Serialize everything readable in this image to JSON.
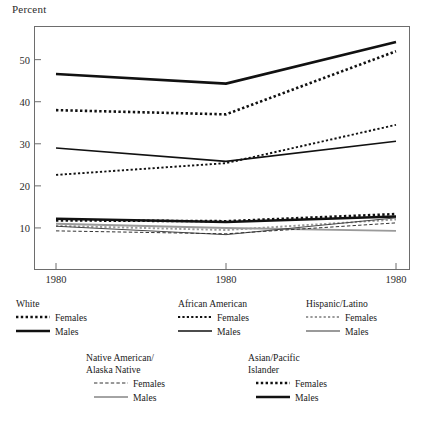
{
  "axis": {
    "y_title": "Percent",
    "y_ticks": [
      10,
      20,
      30,
      40,
      50
    ],
    "x_ticks": [
      "1980",
      "1980",
      "1980"
    ]
  },
  "legend": {
    "groups": [
      {
        "id": "white",
        "heading": "White",
        "entries": [
          {
            "label": "Females",
            "style": "dotted-bold"
          },
          {
            "label": "Males",
            "style": "solid-bold"
          }
        ]
      },
      {
        "id": "african",
        "heading": "African American",
        "entries": [
          {
            "label": "Females",
            "style": "dotted-fine"
          },
          {
            "label": "Males",
            "style": "solid-medium"
          }
        ]
      },
      {
        "id": "hispanic",
        "heading": "Hispanic/Latino",
        "entries": [
          {
            "label": "Females",
            "style": "dotted-gray"
          },
          {
            "label": "Males",
            "style": "solid-gray"
          }
        ]
      },
      {
        "id": "native",
        "heading": "Native American/\nAlaska Native",
        "heading_line1": "Native American/",
        "heading_line2": "Alaska Native",
        "entries": [
          {
            "label": "Females",
            "style": "dashed-thin"
          },
          {
            "label": "Males",
            "style": "solid-thin"
          }
        ]
      },
      {
        "id": "asian",
        "heading": "Asian/Pacific\nIslander",
        "heading_line1": "Asian/Pacific",
        "heading_line2": "Islander",
        "entries": [
          {
            "label": "Females",
            "style": "dotted-bold"
          },
          {
            "label": "Males",
            "style": "solid-bold"
          }
        ]
      }
    ]
  },
  "chart_data": {
    "type": "line",
    "title": "",
    "xlabel": "",
    "ylabel": "Percent",
    "x": [
      "1980",
      "1980",
      "1980"
    ],
    "ylim": [
      0,
      58
    ],
    "xlim": [
      0,
      2
    ],
    "grid": false,
    "legend_position": "below",
    "series": [
      {
        "name": "White Females",
        "group": "White",
        "sex": "Females",
        "style": "dotted-bold",
        "color": "#111111",
        "values": [
          38.0,
          37.0,
          52.0
        ]
      },
      {
        "name": "White Males",
        "group": "White",
        "sex": "Males",
        "style": "solid-bold",
        "color": "#111111",
        "values": [
          46.6,
          44.3,
          54.2
        ]
      },
      {
        "name": "African American Females",
        "group": "African American",
        "sex": "Females",
        "style": "dotted-fine",
        "color": "#111111",
        "values": [
          22.6,
          25.4,
          34.5
        ]
      },
      {
        "name": "African American Males",
        "group": "African American",
        "sex": "Males",
        "style": "solid-medium",
        "color": "#111111",
        "values": [
          29.0,
          25.8,
          30.6
        ]
      },
      {
        "name": "Hispanic/Latino Females",
        "group": "Hispanic/Latino",
        "sex": "Females",
        "style": "dotted-gray",
        "color": "#9a9a9a",
        "values": [
          10.5,
          9.5,
          12.0
        ]
      },
      {
        "name": "Hispanic/Latino Males",
        "group": "Hispanic/Latino",
        "sex": "Males",
        "style": "solid-gray",
        "color": "#9a9a9a",
        "values": [
          11.0,
          10.0,
          9.3
        ]
      },
      {
        "name": "Native American/Alaska Native Females",
        "group": "Native American/Alaska Native",
        "sex": "Females",
        "style": "dashed-thin",
        "color": "#333333",
        "values": [
          9.3,
          8.6,
          11.2
        ]
      },
      {
        "name": "Native American/Alaska Native Males",
        "group": "Native American/Alaska Native",
        "sex": "Males",
        "style": "solid-thin",
        "color": "#333333",
        "values": [
          10.4,
          8.4,
          12.4
        ]
      },
      {
        "name": "Asian/Pacific Islander Females",
        "group": "Asian/Pacific Islander",
        "sex": "Females",
        "style": "dotted-bold",
        "color": "#111111",
        "values": [
          11.8,
          11.6,
          13.3
        ]
      },
      {
        "name": "Asian/Pacific Islander Males",
        "group": "Asian/Pacific Islander",
        "sex": "Males",
        "style": "solid-bold",
        "color": "#111111",
        "values": [
          12.2,
          11.4,
          12.7
        ]
      }
    ]
  }
}
